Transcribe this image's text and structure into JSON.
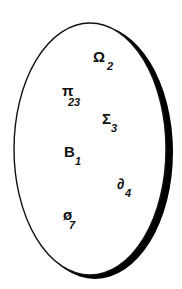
{
  "diagram": {
    "shape": "ellipse",
    "outline_color": "#111111",
    "fill_color": "#ffffff",
    "shadow_color": "#000000",
    "labels": [
      {
        "name": "omega",
        "symbol": "Ω",
        "subscript": "2"
      },
      {
        "name": "pi",
        "symbol": "π",
        "subscript": "23"
      },
      {
        "name": "sigma",
        "symbol": "Σ",
        "subscript": "3"
      },
      {
        "name": "beta",
        "symbol": "B",
        "subscript": "1"
      },
      {
        "name": "partial",
        "symbol": "∂",
        "subscript": "4"
      },
      {
        "name": "phi",
        "symbol": "ø",
        "subscript": "7"
      }
    ]
  }
}
